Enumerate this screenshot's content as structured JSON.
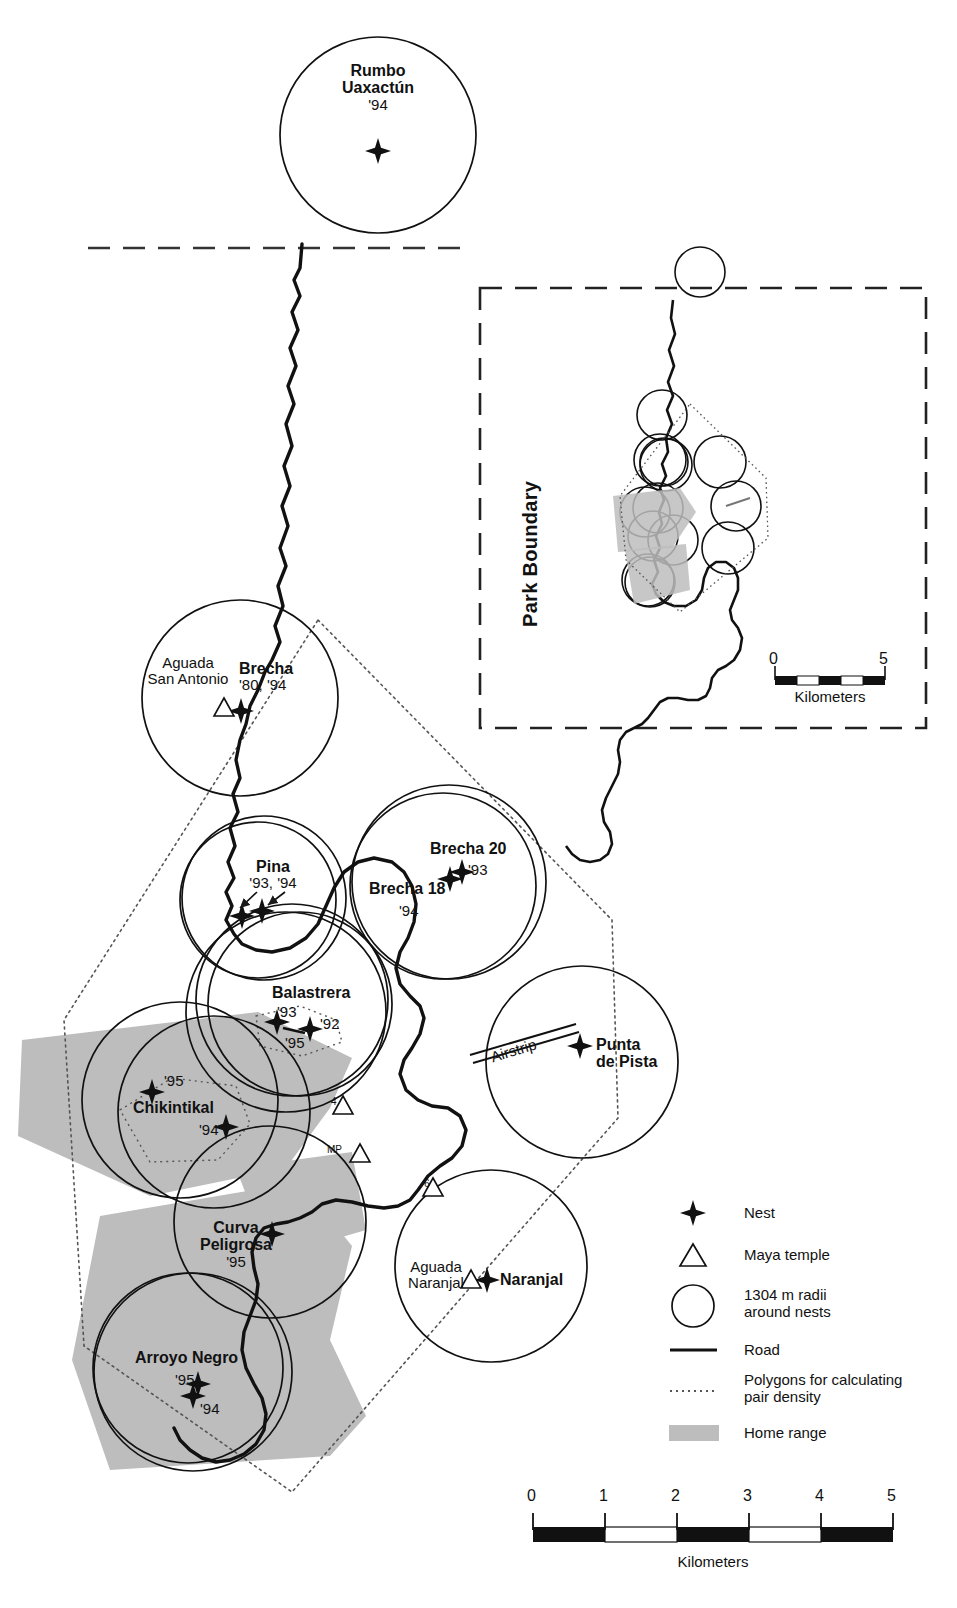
{
  "figure": {
    "type": "map"
  },
  "main_map": {
    "sites": [
      {
        "name": "Rumbo\nUaxactún",
        "label_lines": [
          "Rumbo",
          "Uaxactún"
        ],
        "years": "'94"
      },
      {
        "name": "Brecha",
        "label_lines": [
          "Brecha"
        ],
        "years": "'80, '94"
      },
      {
        "name": "Pina",
        "label_lines": [
          "Pina"
        ],
        "years": "'93, '94"
      },
      {
        "name": "Brecha 20",
        "label_lines": [
          "Brecha 20"
        ],
        "years": "'93"
      },
      {
        "name": "Brecha 18",
        "label_lines": [
          "Brecha 18"
        ],
        "years": "'94"
      },
      {
        "name": "Balastrera",
        "label_lines": [
          "Balastrera"
        ],
        "years": "'93 / '92 / '95"
      },
      {
        "name": "Chikintikal",
        "label_lines": [
          "Chikintikal"
        ],
        "years": "'95 / '94"
      },
      {
        "name": "Punta de Pista",
        "label_lines": [
          "Punta",
          "de Pista"
        ],
        "years": ""
      },
      {
        "name": "Curva Peligrosa",
        "label_lines": [
          "Curva",
          "Peligrosa"
        ],
        "years": "'95"
      },
      {
        "name": "Naranjal",
        "label_lines": [
          "Naranjal"
        ],
        "years": ""
      },
      {
        "name": "Arroyo Negro",
        "label_lines": [
          "Arroyo Negro"
        ],
        "years": "'95 / '94"
      }
    ],
    "labels": {
      "rumbo_l1": "Rumbo",
      "rumbo_l2": "Uaxactún",
      "rumbo_year": "'94",
      "aguada_san_antonio_l1": "Aguada",
      "aguada_san_antonio_l2": "San Antonio",
      "brecha": "Brecha",
      "brecha_year": "'80, '94",
      "pina": "Pina",
      "pina_year": "'93, '94",
      "brecha20": "Brecha 20",
      "brecha20_year": "'93",
      "brecha18": "Brecha 18",
      "brecha18_year": "'94",
      "balastrera": "Balastrera",
      "balastrera_y93": "'93",
      "balastrera_y92": "'92",
      "balastrera_y95": "'95",
      "chikintikal": "Chikintikal",
      "chikintikal_y95": "'95",
      "chikintikal_y94": "'94",
      "airstrip": "Airstrip",
      "punta_l1": "Punta",
      "punta_l2": "de Pista",
      "curva_l1": "Curva",
      "curva_l2": "Peligrosa",
      "curva_year": "'95",
      "aguada_naranjal_l1": "Aguada",
      "aguada_naranjal_l2": "Naranjal",
      "naranjal": "Naranjal",
      "arroyo": "Arroyo Negro",
      "arroyo_y95": "'95",
      "arroyo_y94": "'94",
      "temple_4": "4",
      "temple_mp": "MP",
      "temple_6": "6"
    }
  },
  "inset_map": {
    "park_boundary_label": "Park Boundary",
    "scale": {
      "min": "0",
      "max": "5",
      "caption": "Kilometers"
    }
  },
  "legend": {
    "items": [
      {
        "icon": "nest-star-icon",
        "label": "Nest"
      },
      {
        "icon": "maya-temple-triangle-icon",
        "label": "Maya temple"
      },
      {
        "icon": "radius-circle-icon",
        "label": "1304 m radii\naround nests",
        "line1": "1304 m radii",
        "line2": "around nests"
      },
      {
        "icon": "road-line-icon",
        "label": "Road"
      },
      {
        "icon": "dotted-polygon-icon",
        "label": "Polygons for calculating\npair density",
        "line1": "Polygons for calculating",
        "line2": "pair density"
      },
      {
        "icon": "home-range-swatch-icon",
        "label": "Home range"
      }
    ]
  },
  "main_scale": {
    "ticks": [
      "0",
      "1",
      "2",
      "3",
      "4",
      "5"
    ],
    "caption": "Kilometers"
  },
  "colors": {
    "ink": "#1a1a1a",
    "home_range_fill": "#bdbdbd",
    "paper": "#ffffff"
  }
}
